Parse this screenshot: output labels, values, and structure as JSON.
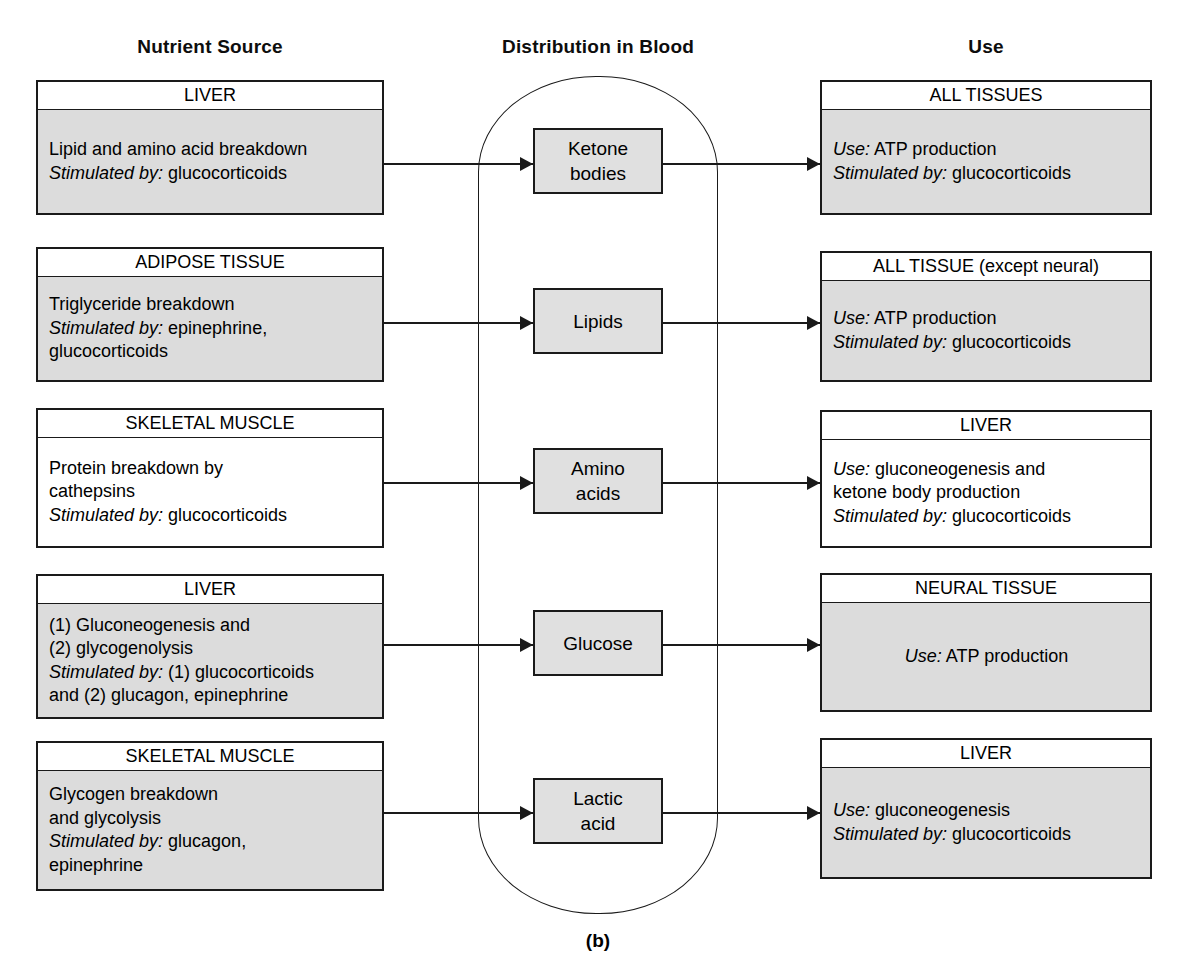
{
  "figure": {
    "caption": "(b)",
    "columns": {
      "left_heading": "Nutrient Source",
      "center_heading": "Distribution in Blood",
      "right_heading": "Use"
    },
    "colors": {
      "shaded_fill": "#dcdcdc",
      "center_fill": "#e0e0e0",
      "plain_fill": "#ffffff",
      "stroke": "#1a1a1a",
      "background": "#ffffff"
    }
  },
  "rows": [
    {
      "source": {
        "header": "LIVER",
        "shaded": true,
        "lines": [
          {
            "text": "Lipid and amino acid breakdown"
          },
          {
            "label": "Stimulated by:",
            "text": " glucocorticoids"
          }
        ]
      },
      "metabolite": {
        "label": "Ketone\nbodies"
      },
      "use": {
        "header": "ALL TISSUES",
        "shaded": true,
        "centered": false,
        "lines": [
          {
            "label": "Use:",
            "text": " ATP production"
          },
          {
            "label": "Stimulated by:",
            "text": " glucocorticoids"
          }
        ]
      }
    },
    {
      "source": {
        "header": "ADIPOSE TISSUE",
        "shaded": true,
        "lines": [
          {
            "text": "Triglyceride breakdown"
          },
          {
            "label": "Stimulated by:",
            "text": " epinephrine,"
          },
          {
            "text": "glucocorticoids"
          }
        ]
      },
      "metabolite": {
        "label": "Lipids"
      },
      "use": {
        "header": "ALL TISSUE (except neural)",
        "shaded": true,
        "centered": false,
        "lines": [
          {
            "label": "Use:",
            "text": " ATP production"
          },
          {
            "label": "Stimulated by:",
            "text": " glucocorticoids"
          }
        ]
      }
    },
    {
      "source": {
        "header": "SKELETAL MUSCLE",
        "shaded": false,
        "lines": [
          {
            "text": "Protein breakdown by"
          },
          {
            "text": "cathepsins"
          },
          {
            "label": "Stimulated by:",
            "text": " glucocorticoids"
          }
        ]
      },
      "metabolite": {
        "label": "Amino\nacids"
      },
      "use": {
        "header": "LIVER",
        "shaded": false,
        "centered": false,
        "lines": [
          {
            "label": "Use:",
            "text": " gluconeogenesis and"
          },
          {
            "text": "ketone body production"
          },
          {
            "label": "Stimulated by:",
            "text": " glucocorticoids"
          }
        ]
      }
    },
    {
      "source": {
        "header": "LIVER",
        "shaded": true,
        "lines": [
          {
            "text": "(1) Gluconeogenesis and"
          },
          {
            "text": "(2) glycogenolysis"
          },
          {
            "label": "Stimulated by:",
            "text": " (1) glucocorticoids"
          },
          {
            "text": "and (2) glucagon, epinephrine"
          }
        ]
      },
      "metabolite": {
        "label": "Glucose"
      },
      "use": {
        "header": "NEURAL TISSUE",
        "shaded": true,
        "centered": true,
        "lines": [
          {
            "label": "Use:",
            "text": " ATP production"
          }
        ]
      }
    },
    {
      "source": {
        "header": "SKELETAL MUSCLE",
        "shaded": true,
        "lines": [
          {
            "text": "Glycogen breakdown"
          },
          {
            "text": "and glycolysis"
          },
          {
            "label": "Stimulated by:",
            "text": " glucagon,"
          },
          {
            "text": "epinephrine"
          }
        ]
      },
      "metabolite": {
        "label": "Lactic\nacid"
      },
      "use": {
        "header": "LIVER",
        "shaded": true,
        "centered": false,
        "lines": [
          {
            "label": "Use:",
            "text": " gluconeogenesis"
          },
          {
            "label": "Stimulated by:",
            "text": " glucocorticoids"
          }
        ]
      }
    }
  ]
}
